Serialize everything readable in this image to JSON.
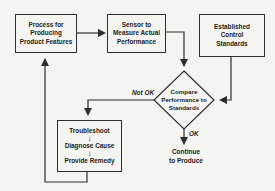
{
  "flowchart": {
    "nodes": {
      "process": {
        "label": "Process for\nProducing\nProduct Features"
      },
      "sensor": {
        "label": "Sensor to\nMeasure Actual\nPerformance"
      },
      "standards": {
        "label": "Established\nControl\nStandards"
      },
      "compare": {
        "label": "Compare\nPerformance to\nStandards"
      },
      "troubleshoot": {
        "steps": [
          "Troubleshoot",
          "Diagnose Cause",
          "Provide Remedy"
        ]
      },
      "continue": {
        "label": "Continue\nto Produce"
      }
    },
    "edge_labels": {
      "not_ok": "Not OK",
      "ok": "OK"
    },
    "icons": {
      "down_arrow": "↓"
    },
    "colors": {
      "line": "#2e2e2e",
      "text": "#1c1c1c",
      "background": "#f4f4f1"
    }
  }
}
